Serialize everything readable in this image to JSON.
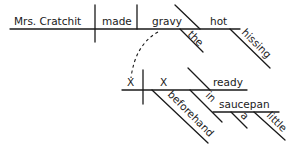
{
  "diagram": {
    "type": "sentence-diagram",
    "main_clause": {
      "subject": "Mrs. Cratchit",
      "verb": "made",
      "direct_object": "gravy",
      "object_modifiers": [
        "the",
        "hot",
        "hissing"
      ]
    },
    "participial_clause": {
      "subject": "X",
      "verb": "X",
      "predicate_adjective": "ready",
      "adverb": "beforehand",
      "preposition": "in",
      "object_of_preposition": "saucepan",
      "object_modifiers": [
        "a",
        "little"
      ]
    },
    "colors": {
      "ink": "#1a1a1a",
      "background": "#ffffff"
    }
  }
}
